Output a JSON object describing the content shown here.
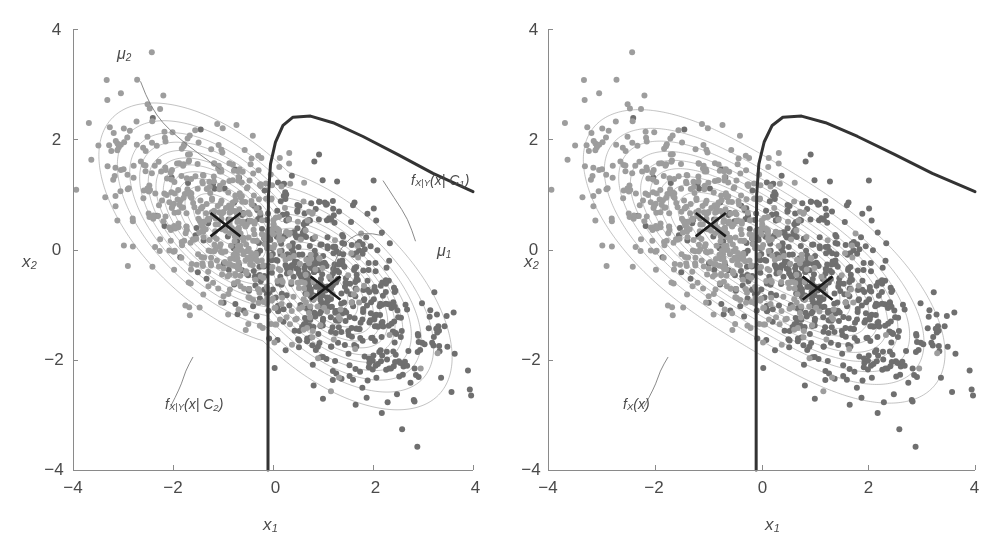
{
  "figure": {
    "width": 1004,
    "height": 551,
    "background": "#ffffff"
  },
  "style": {
    "class1_point_color": "#6f6f6f",
    "class2_point_color": "#9d9d9d",
    "contour_color": "#9a9a9a",
    "boundary_color": "#333333",
    "axis_color": "#8a8a8a",
    "text_color": "#4a4a4a",
    "marker_color": "#1a1a1a"
  },
  "chart_data": {
    "type": "scatter",
    "title": "",
    "xlabel": "x1",
    "ylabel": "x2",
    "xlim": [
      -4,
      4
    ],
    "ylim": [
      -4,
      4
    ],
    "xticks": [
      -4,
      -2,
      0,
      2,
      4
    ],
    "yticks": [
      -4,
      -2,
      0,
      2,
      4
    ],
    "xticklabels": [
      "−4",
      "−2",
      "0",
      "2",
      "4"
    ],
    "yticklabels": [
      "−4",
      "−2",
      "0",
      "2",
      "4"
    ],
    "grid": false,
    "legend": "none",
    "panels": [
      {
        "id": "left",
        "name": "class-conditional-densities",
        "xlabel": "x1",
        "ylabel": "x2",
        "annotations": [
          {
            "name": "mu2",
            "text": "μ2",
            "base": "μ",
            "sub": "2",
            "x": -2.9,
            "y": 3.3
          },
          {
            "name": "mu1",
            "text": "μ1",
            "base": "μ",
            "sub": "1",
            "x": 2.3,
            "y": 0.15
          },
          {
            "name": "f-x-given-c1",
            "text": "fX|Y(x| C1)",
            "x": 1.55,
            "y": 1.35
          },
          {
            "name": "f-x-given-c2",
            "text": "fX|Y(x| C2)",
            "x": -2.75,
            "y": -3.05
          }
        ]
      },
      {
        "id": "right",
        "name": "marginal-density",
        "xlabel": "x1",
        "ylabel": "x2",
        "annotations": [
          {
            "name": "f-x",
            "text": "fX(x)",
            "x": -2.55,
            "y": -3.05
          }
        ]
      }
    ],
    "series": [
      {
        "name": "class C1",
        "point_color": "#6f6f6f",
        "n_points": 600,
        "mean": [
          1.05,
          -0.7
        ],
        "cov": [
          [
            1.25,
            -0.62
          ],
          [
            -0.62,
            0.95
          ]
        ],
        "marker_center": [
          1.05,
          -0.7
        ],
        "marker": "x-cross"
      },
      {
        "name": "class C2",
        "point_color": "#9d9d9d",
        "n_points": 600,
        "mean": [
          -0.95,
          0.45
        ],
        "cov": [
          [
            1.25,
            -0.62
          ],
          [
            -0.62,
            0.95
          ]
        ],
        "marker_center": [
          -0.95,
          0.45
        ],
        "marker": "x-cross"
      }
    ],
    "decision_boundary": {
      "name": "bayes-decision-boundary",
      "color": "#333333",
      "width": 3.0,
      "description": "quadratic boundary: near-vertical at x1 = -0.1 below x2 = 1.6, arching over to the right with apex near (0.35, 2.4) and descending to (4, 1.1)"
    },
    "contours": {
      "levels": 12,
      "color": "#9a9a9a",
      "linewidth": 0.6
    }
  },
  "labels": {
    "x_axis": "x",
    "x_axis_sub": "1",
    "y_axis": "x",
    "y_axis_sub": "2",
    "mu1_base": "μ",
    "mu1_sub": "1",
    "mu2_base": "μ",
    "mu2_sub": "2",
    "f_c1_f": "f",
    "f_c1_sub": "X|Y",
    "f_c1_arg": "(x| C",
    "f_c1_argsub": "1",
    "f_c1_close": ")",
    "f_c2_f": "f",
    "f_c2_sub": "X|Y",
    "f_c2_arg": "(x| C",
    "f_c2_argsub": "2",
    "f_c2_close": ")",
    "f_x_f": "f",
    "f_x_sub": "X",
    "f_x_arg": "(x)",
    "tick_m4": "−4",
    "tick_m2": "−2",
    "tick_0": "0",
    "tick_2": "2",
    "tick_4": "4"
  }
}
